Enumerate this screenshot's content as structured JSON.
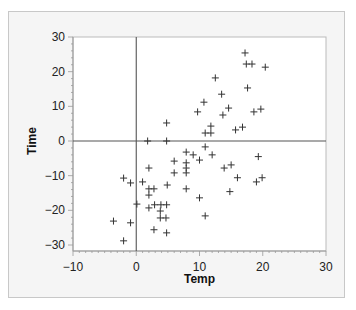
{
  "chart_data": {
    "type": "scatter",
    "title": "",
    "xlabel": "Temp",
    "ylabel": "Time",
    "xlim": [
      -10,
      30
    ],
    "ylim": [
      -30,
      30
    ],
    "xticks": [
      -10,
      0,
      10,
      20,
      30
    ],
    "yticks": [
      -30,
      -20,
      -10,
      0,
      10,
      20,
      30
    ],
    "reference_lines": {
      "x": 0,
      "y": 0
    },
    "grid": false,
    "marker": "+",
    "legend": null,
    "points": [
      [
        17.2,
        25.4
      ],
      [
        17.4,
        22.2
      ],
      [
        18.3,
        22.2
      ],
      [
        20.4,
        21.3
      ],
      [
        12.5,
        18.2
      ],
      [
        17.6,
        15.3
      ],
      [
        13.5,
        13.5
      ],
      [
        10.7,
        11.2
      ],
      [
        9.7,
        8.4
      ],
      [
        14.6,
        9.5
      ],
      [
        13.7,
        7.5
      ],
      [
        18.6,
        8.4
      ],
      [
        19.7,
        9.2
      ],
      [
        11.8,
        4.3
      ],
      [
        10.9,
        2.3
      ],
      [
        11.8,
        2.3
      ],
      [
        15.7,
        3.2
      ],
      [
        16.8,
        4.0
      ],
      [
        4.8,
        5.2
      ],
      [
        1.8,
        0.0
      ],
      [
        4.8,
        0.0
      ],
      [
        10.9,
        -1.7
      ],
      [
        7.9,
        -3.2
      ],
      [
        9.0,
        -4.0
      ],
      [
        12.0,
        -4.0
      ],
      [
        6.0,
        -5.8
      ],
      [
        7.9,
        -6.3
      ],
      [
        10.0,
        -5.5
      ],
      [
        7.9,
        -7.8
      ],
      [
        2.0,
        -7.8
      ],
      [
        6.0,
        -9.2
      ],
      [
        7.9,
        -9.2
      ],
      [
        1.0,
        -11.8
      ],
      [
        4.9,
        -12.7
      ],
      [
        7.9,
        -13.8
      ],
      [
        19.3,
        -4.5
      ],
      [
        13.9,
        -7.8
      ],
      [
        15.0,
        -6.9
      ],
      [
        16.0,
        -10.6
      ],
      [
        19.0,
        -11.8
      ],
      [
        19.9,
        -10.6
      ],
      [
        14.8,
        -14.6
      ],
      [
        10.0,
        -16.4
      ],
      [
        10.9,
        -21.6
      ],
      [
        -2.0,
        -10.7
      ],
      [
        -0.9,
        -12.1
      ],
      [
        2.0,
        -13.8
      ],
      [
        2.8,
        -13.8
      ],
      [
        2.0,
        -15.6
      ],
      [
        0.1,
        -18.2
      ],
      [
        2.0,
        -19.3
      ],
      [
        2.9,
        -18.4
      ],
      [
        3.9,
        -18.4
      ],
      [
        4.8,
        -18.4
      ],
      [
        3.8,
        -20.2
      ],
      [
        3.8,
        -22.2
      ],
      [
        4.7,
        -22.2
      ],
      [
        -3.6,
        -23.1
      ],
      [
        -0.9,
        -23.6
      ],
      [
        2.8,
        -25.6
      ],
      [
        4.8,
        -26.5
      ],
      [
        -2.0,
        -28.8
      ]
    ]
  },
  "colors": {
    "frame_bg": "#f5f5f5",
    "plot_bg": "#ffffff",
    "marker": "#333333",
    "axis": "#555555"
  }
}
